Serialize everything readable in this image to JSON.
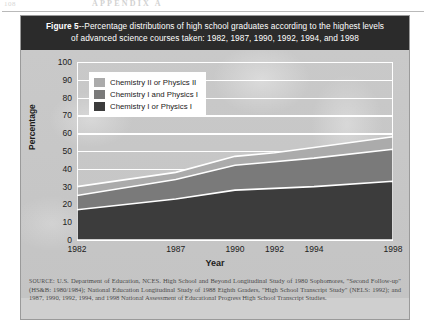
{
  "page": {
    "folio": "108",
    "running_head": "APPENDIX A"
  },
  "figure": {
    "title_line1_prefix": "Figure 5",
    "title_line1": "--Percentage distributions of high school graduates according to the highest levels",
    "title_line2": "of advanced science courses taken: 1982, 1987, 1990, 1992, 1994, and 1998",
    "source_label": "SOURCE:",
    "source_text": "U.S. Department of Education, NCES. High School and Beyond Longitudinal Study of 1980 Sophomores, \"Second Follow-up\" (HS&B: 1980/1984); National Education Longitudinal Study of 1988 Eighth Graders, \"High School Transcript Study\" (NELS: 1992); and 1987, 1990, 1992, 1994, and 1998 National Assessment of Educational Progress High School Transcript Studies."
  },
  "chart_data": {
    "type": "area",
    "stacked": true,
    "title": "Figure 5--Percentage distributions of high school graduates according to the highest levels of advanced science courses taken: 1982, 1987, 1990, 1992, 1994, and 1998",
    "xlabel": "Year",
    "ylabel": "Percentage",
    "x": [
      1982,
      1987,
      1990,
      1992,
      1994,
      1998
    ],
    "xtick_labels": [
      "1982",
      "1987",
      "1990",
      "1992",
      "1994",
      "1998"
    ],
    "ytick_labels": [
      "0",
      "10",
      "20",
      "30",
      "40",
      "50",
      "60",
      "70",
      "80",
      "90",
      "100"
    ],
    "yticks": [
      0,
      10,
      20,
      30,
      40,
      50,
      60,
      70,
      80,
      90,
      100
    ],
    "ylim": [
      0,
      100
    ],
    "xlim": [
      1982,
      1998
    ],
    "grid": true,
    "grid_color": "#ffffff",
    "legend_position": "upper-left-inside",
    "series": [
      {
        "name": "Chemistry I or Physics I",
        "color": "#3c3c3c",
        "values": [
          17,
          23,
          28,
          29,
          30,
          33
        ],
        "cumulative_top": [
          17,
          23,
          28,
          29,
          30,
          33
        ]
      },
      {
        "name": "Chemistry I and Physics I",
        "color": "#7a7a7a",
        "values": [
          8,
          11,
          14,
          15,
          16,
          18
        ],
        "cumulative_top": [
          25,
          34,
          42,
          44,
          46,
          51
        ]
      },
      {
        "name": "Chemistry II or Physics II",
        "color": "#ababab",
        "values": [
          5,
          4,
          5,
          5,
          6,
          7
        ],
        "cumulative_top": [
          30,
          38,
          47,
          49,
          52,
          58
        ]
      }
    ]
  }
}
